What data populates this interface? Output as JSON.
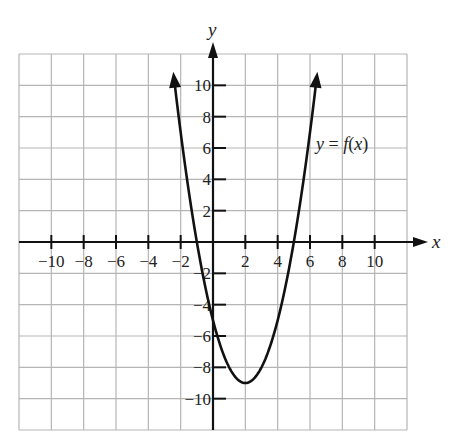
{
  "top_text_cropped": "",
  "chart_data": {
    "type": "line",
    "title": "",
    "function_label": "y = f(x)",
    "function": "f(x) = x^2 - 4x - 5",
    "vertex": [
      2,
      -9
    ],
    "y_intercept": -5,
    "x_intercepts": [
      -1,
      5
    ],
    "xlabel": "x",
    "ylabel": "y",
    "xlim": [
      -12,
      12
    ],
    "ylim": [
      -12,
      12
    ],
    "grid": true,
    "grid_step": 2,
    "x_tick_labels": [
      "-10",
      "-8",
      "-6",
      "-4",
      "-2",
      "2",
      "4",
      "6",
      "8",
      "10"
    ],
    "y_tick_labels": [
      "10",
      "8",
      "6",
      "4",
      "2",
      "-2",
      "-4",
      "-6",
      "-8",
      "-10"
    ],
    "x_ticks": [
      -10,
      -8,
      -6,
      -4,
      -2,
      2,
      4,
      6,
      8,
      10
    ],
    "y_ticks": [
      10,
      8,
      6,
      4,
      2,
      -2,
      -4,
      -6,
      -8,
      -10
    ],
    "series": [
      {
        "name": "y = f(x)",
        "x": [
          -2.4,
          -2,
          -1,
          0,
          1,
          2,
          3,
          4,
          5,
          6,
          6.4
        ],
        "y": [
          10.36,
          7,
          0,
          -5,
          -8,
          -9,
          -8,
          -5,
          0,
          7,
          10.36
        ],
        "arrows_both_ends": true
      }
    ],
    "colors": {
      "grid": "#b5b5b5",
      "axis": "#111111",
      "curve": "#111111"
    }
  }
}
